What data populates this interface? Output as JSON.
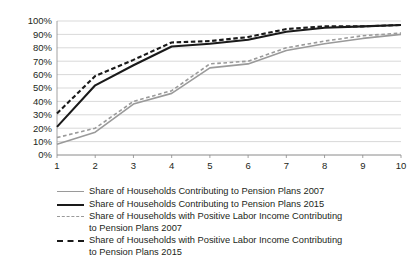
{
  "chart_data": {
    "type": "line",
    "title": "",
    "xlabel": "",
    "ylabel": "",
    "categories": [
      "1",
      "2",
      "3",
      "4",
      "5",
      "6",
      "7",
      "8",
      "9",
      "10"
    ],
    "x": [
      1,
      2,
      3,
      4,
      5,
      6,
      7,
      8,
      9,
      10
    ],
    "ylim": [
      0,
      100
    ],
    "xlim": [
      1,
      10
    ],
    "y_tick_labels": [
      "0%",
      "10%",
      "20%",
      "30%",
      "40%",
      "50%",
      "60%",
      "70%",
      "80%",
      "90%",
      "100%"
    ],
    "y_tick_values": [
      0,
      10,
      20,
      30,
      40,
      50,
      60,
      70,
      80,
      90,
      100
    ],
    "x_tick_labels": [
      "1",
      "2",
      "3",
      "4",
      "5",
      "6",
      "7",
      "8",
      "9",
      "10"
    ],
    "grid": "horizontal",
    "legend_position": "below",
    "units": "percent",
    "series": [
      {
        "name": "Share of Households Contributing to Pension Plans 2007",
        "style": "solid",
        "color": "#9a9a9a",
        "width": 1.6,
        "values": [
          8,
          17,
          38,
          46,
          65,
          68,
          78,
          83,
          87,
          90
        ]
      },
      {
        "name": "Share of Households Contributing to Pension Plans 2015",
        "style": "solid",
        "color": "#1a1a1a",
        "width": 2.1,
        "values": [
          21,
          52,
          67,
          81,
          83,
          86,
          92,
          95,
          96,
          97
        ]
      },
      {
        "name": "Share of Households with Positive Labor Income Contributing to Pension Plans 2007",
        "style": "dashed",
        "color": "#9a9a9a",
        "width": 1.6,
        "values": [
          13,
          20,
          40,
          48,
          68,
          70,
          80,
          85,
          89,
          91
        ]
      },
      {
        "name": "Share of Households with Positive Labor Income Contributing to Pension Plans 2015",
        "style": "dashed",
        "color": "#1a1a1a",
        "width": 2.1,
        "values": [
          31,
          59,
          71,
          84,
          85,
          88,
          94,
          96,
          96,
          97
        ]
      }
    ]
  },
  "legend": {
    "items": [
      {
        "label": "Share of Households Contributing to Pension Plans 2007",
        "style": "solid",
        "color": "#9a9a9a",
        "thickness": "1.6px"
      },
      {
        "label": "Share of Households Contributing to Pension Plans 2015",
        "style": "solid",
        "color": "#1a1a1a",
        "thickness": "2.4px"
      },
      {
        "label": "Share of Households with Positive Labor Income Contributing\nto Pension Plans 2007",
        "style": "dashed",
        "color": "#9a9a9a",
        "thickness": "1.6px"
      },
      {
        "label": "Share of Households with Positive Labor Income Contributing\nto Pension Plans 2015",
        "style": "dashed",
        "color": "#1a1a1a",
        "thickness": "2.4px"
      }
    ]
  }
}
